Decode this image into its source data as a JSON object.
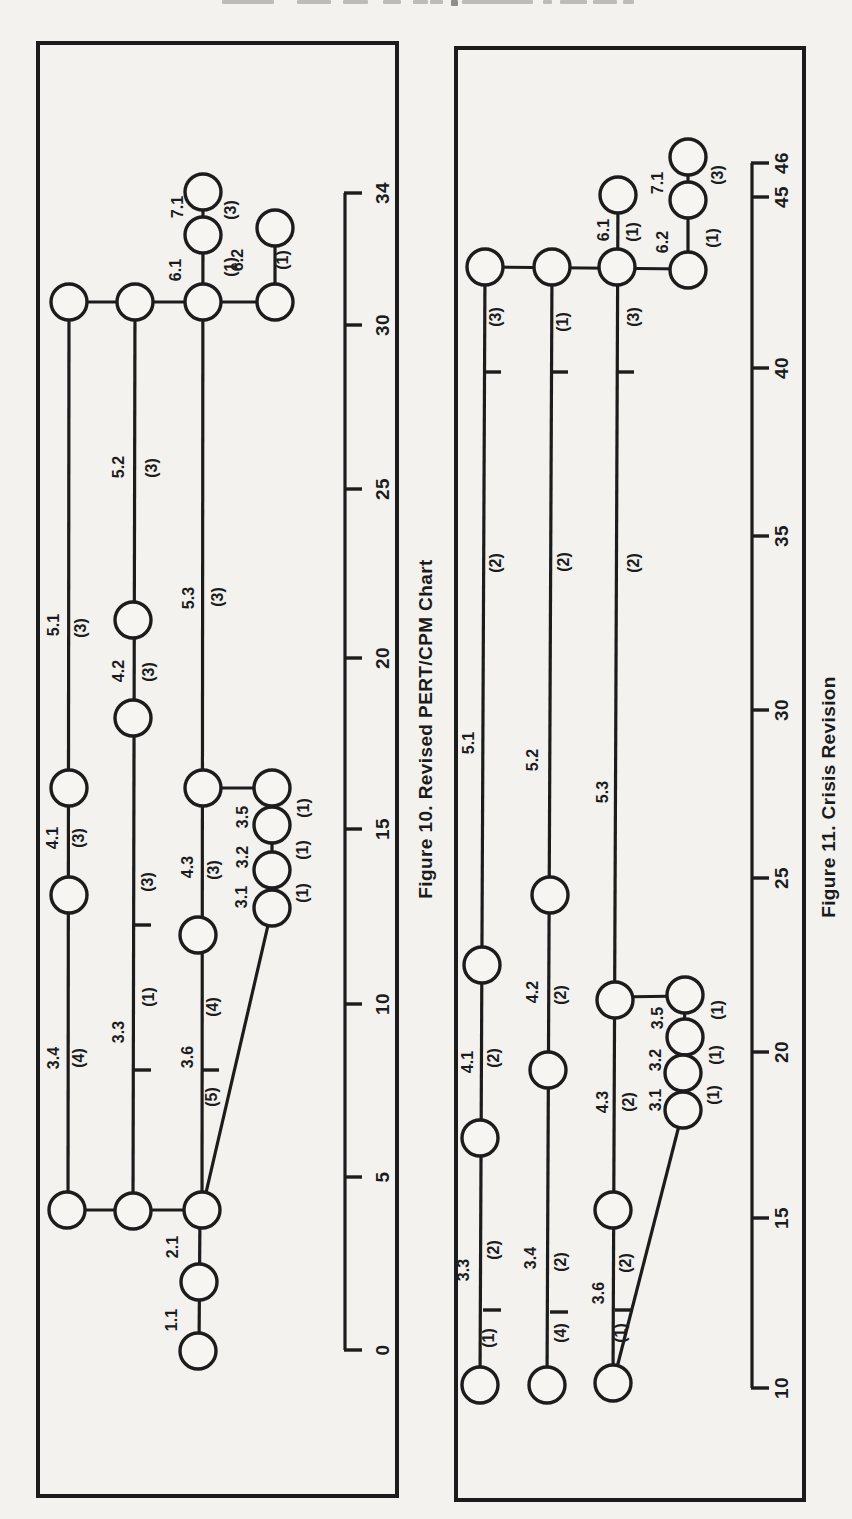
{
  "page": {
    "paper": "#f3f2ee",
    "ink": "#1c1c1c",
    "node_fill": "#f6f5f2"
  },
  "header_fragment": {
    "note": "cut-off bottoms of a text line at top edge of scan",
    "color": "#bdbcb8",
    "dark_color": "#8f8e8a",
    "dashes": [
      {
        "x": 222,
        "w": 52,
        "h": 4,
        "dark": false
      },
      {
        "x": 297,
        "w": 34,
        "h": 4,
        "dark": false
      },
      {
        "x": 343,
        "w": 25,
        "h": 4,
        "dark": false
      },
      {
        "x": 383,
        "w": 18,
        "h": 4,
        "dark": false
      },
      {
        "x": 413,
        "w": 15,
        "h": 4,
        "dark": false
      },
      {
        "x": 430,
        "w": 13,
        "h": 4,
        "dark": false
      },
      {
        "x": 451,
        "w": 7,
        "h": 6,
        "dark": true
      },
      {
        "x": 462,
        "w": 71,
        "h": 4,
        "dark": false
      },
      {
        "x": 543,
        "w": 9,
        "h": 4,
        "dark": false
      },
      {
        "x": 560,
        "w": 27,
        "h": 4,
        "dark": false
      },
      {
        "x": 593,
        "w": 24,
        "h": 4,
        "dark": false
      },
      {
        "x": 623,
        "w": 11,
        "h": 4,
        "dark": false
      }
    ]
  },
  "figures": [
    {
      "id": "figure10",
      "caption": "Figure 10. Revised PERT/CPM Chart",
      "caption_pos": {
        "x": 426,
        "y": 729
      },
      "box": {
        "x": 38,
        "y": 43,
        "w": 359,
        "h": 1453
      },
      "activity_ids": [
        "1.1",
        "2.1",
        "3.1",
        "3.2",
        "3.3",
        "3.4",
        "3.5",
        "3.6",
        "4.1",
        "4.2",
        "4.3",
        "5.1",
        "5.2",
        "5.3",
        "6.1",
        "6.2",
        "7.1"
      ],
      "axis": {
        "x": 345,
        "y1": 193,
        "y2": 1350,
        "tick_len": 17,
        "label_x": 382,
        "ticks": [
          {
            "v": "34",
            "y": 193
          },
          {
            "v": "30",
            "y": 325
          },
          {
            "v": "25",
            "y": 489
          },
          {
            "v": "20",
            "y": 658
          },
          {
            "v": "15",
            "y": 829
          },
          {
            "v": "10",
            "y": 1004
          },
          {
            "v": "5",
            "y": 1177
          },
          {
            "v": "0",
            "y": 1350
          }
        ]
      },
      "lines": [
        [
          69,
          302,
          68,
          1210
        ],
        [
          135,
          302,
          133,
          1211
        ],
        [
          203,
          192,
          202,
          1210
        ],
        [
          275,
          228,
          275,
          302
        ],
        [
          272,
          788,
          272,
          908
        ],
        [
          200,
          1210,
          199,
          1351
        ],
        [
          69,
          302,
          275,
          302
        ],
        [
          67,
          1210,
          202,
          1210
        ],
        [
          203,
          788,
          272,
          788
        ],
        [
          272,
          908,
          202,
          1210
        ]
      ],
      "nodes": [
        [
          69,
          302
        ],
        [
          135,
          302
        ],
        [
          203,
          302
        ],
        [
          275,
          302
        ],
        [
          203,
          235
        ],
        [
          203,
          192
        ],
        [
          275,
          228
        ],
        [
          69,
          788
        ],
        [
          69,
          895
        ],
        [
          133,
          620
        ],
        [
          133,
          718
        ],
        [
          203,
          788
        ],
        [
          198,
          935
        ],
        [
          272,
          788
        ],
        [
          272,
          825
        ],
        [
          272,
          870
        ],
        [
          272,
          908
        ],
        [
          67,
          1210
        ],
        [
          133,
          1211
        ],
        [
          202,
          1210
        ],
        [
          199,
          1282
        ],
        [
          198,
          1351
        ]
      ],
      "row_ticks": [
        [
          135,
          925
        ],
        [
          135,
          1070
        ],
        [
          203,
          1070
        ]
      ],
      "labels": [
        {
          "t": "5.1",
          "x": 53,
          "y": 625
        },
        {
          "t": "(3)",
          "x": 80,
          "y": 628
        },
        {
          "t": "4.1",
          "x": 52,
          "y": 838
        },
        {
          "t": "(3)",
          "x": 78,
          "y": 838
        },
        {
          "t": "3.4",
          "x": 53,
          "y": 1058
        },
        {
          "t": "(4)",
          "x": 78,
          "y": 1058
        },
        {
          "t": "5.2",
          "x": 118,
          "y": 467
        },
        {
          "t": "(3)",
          "x": 151,
          "y": 468
        },
        {
          "t": "4.2",
          "x": 118,
          "y": 671
        },
        {
          "t": "(3)",
          "x": 148,
          "y": 672
        },
        {
          "t": "(3)",
          "x": 147,
          "y": 882
        },
        {
          "t": "(1)",
          "x": 148,
          "y": 997
        },
        {
          "t": "3.3",
          "x": 118,
          "y": 1032
        },
        {
          "t": "5.3",
          "x": 188,
          "y": 598
        },
        {
          "t": "(3)",
          "x": 217,
          "y": 597
        },
        {
          "t": "4.3",
          "x": 187,
          "y": 867
        },
        {
          "t": "(3)",
          "x": 213,
          "y": 870
        },
        {
          "t": "(4)",
          "x": 212,
          "y": 1007
        },
        {
          "t": "3.6",
          "x": 187,
          "y": 1057
        },
        {
          "t": "(5)",
          "x": 211,
          "y": 1097
        },
        {
          "t": "6.1",
          "x": 175,
          "y": 270
        },
        {
          "t": "(1)",
          "x": 230,
          "y": 267
        },
        {
          "t": "7.1",
          "x": 177,
          "y": 207
        },
        {
          "t": "(3)",
          "x": 230,
          "y": 210
        },
        {
          "t": "6.2",
          "x": 237,
          "y": 260
        },
        {
          "t": "(1)",
          "x": 282,
          "y": 260
        },
        {
          "t": "3.5",
          "x": 242,
          "y": 817
        },
        {
          "t": "(1)",
          "x": 303,
          "y": 808
        },
        {
          "t": "3.2",
          "x": 242,
          "y": 857
        },
        {
          "t": "(1)",
          "x": 302,
          "y": 850
        },
        {
          "t": "3.1",
          "x": 241,
          "y": 897
        },
        {
          "t": "(1)",
          "x": 302,
          "y": 893
        },
        {
          "t": "2.1",
          "x": 172,
          "y": 1247
        },
        {
          "t": "1.1",
          "x": 171,
          "y": 1320
        }
      ]
    },
    {
      "id": "figure11",
      "caption": "Figure 11. Crisis Revision",
      "caption_pos": {
        "x": 829,
        "y": 797
      },
      "box": {
        "x": 456,
        "y": 48,
        "w": 348,
        "h": 1452
      },
      "activity_ids": [
        "3.1",
        "3.2",
        "3.3",
        "3.4",
        "3.5",
        "3.6",
        "4.1",
        "4.2",
        "4.3",
        "5.1",
        "5.2",
        "5.3",
        "6.1",
        "6.2",
        "7.1"
      ],
      "axis": {
        "x": 752,
        "y1": 163,
        "y2": 1388,
        "tick_len": 17,
        "label_x": 781,
        "ticks": [
          {
            "v": "46",
            "y": 163
          },
          {
            "v": "45",
            "y": 197
          },
          {
            "v": "40",
            "y": 368
          },
          {
            "v": "35",
            "y": 536
          },
          {
            "v": "30",
            "y": 710
          },
          {
            "v": "25",
            "y": 878
          },
          {
            "v": "20",
            "y": 1052
          },
          {
            "v": "15",
            "y": 1218
          },
          {
            "v": "10",
            "y": 1388
          }
        ]
      },
      "lines": [
        [
          485,
          267,
          480,
          1385
        ],
        [
          552,
          267,
          547,
          1385
        ],
        [
          618,
          195,
          613,
          1383
        ],
        [
          688,
          157,
          688,
          270
        ],
        [
          685,
          995,
          683,
          1110
        ],
        [
          485,
          267,
          688,
          269
        ],
        [
          616,
          997,
          685,
          996
        ],
        [
          683,
          1110,
          613,
          1383
        ]
      ],
      "nodes": [
        [
          485,
          267
        ],
        [
          552,
          267
        ],
        [
          617,
          267
        ],
        [
          688,
          270
        ],
        [
          618,
          195
        ],
        [
          688,
          200
        ],
        [
          688,
          157
        ],
        [
          482,
          965
        ],
        [
          480,
          1138
        ],
        [
          480,
          1385
        ],
        [
          550,
          895
        ],
        [
          548,
          1070
        ],
        [
          547,
          1385
        ],
        [
          615,
          1000
        ],
        [
          613,
          1210
        ],
        [
          613,
          1383
        ],
        [
          685,
          995
        ],
        [
          685,
          1037
        ],
        [
          683,
          1073
        ],
        [
          683,
          1110
        ]
      ],
      "row_ticks": [
        [
          485,
          372
        ],
        [
          552,
          372
        ],
        [
          618,
          372
        ],
        [
          485,
          1310
        ],
        [
          552,
          1312
        ],
        [
          617,
          1310
        ]
      ],
      "labels": [
        {
          "t": "(3)",
          "x": 495,
          "y": 317
        },
        {
          "t": "(1)",
          "x": 562,
          "y": 322
        },
        {
          "t": "(3)",
          "x": 633,
          "y": 317
        },
        {
          "t": "5.1",
          "x": 468,
          "y": 743
        },
        {
          "t": "(2)",
          "x": 495,
          "y": 563
        },
        {
          "t": "5.2",
          "x": 532,
          "y": 760
        },
        {
          "t": "(2)",
          "x": 563,
          "y": 562
        },
        {
          "t": "5.3",
          "x": 602,
          "y": 792
        },
        {
          "t": "(2)",
          "x": 633,
          "y": 563
        },
        {
          "t": "4.1",
          "x": 467,
          "y": 1062
        },
        {
          "t": "(2)",
          "x": 493,
          "y": 1058
        },
        {
          "t": "4.2",
          "x": 532,
          "y": 992
        },
        {
          "t": "(2)",
          "x": 560,
          "y": 995
        },
        {
          "t": "4.3",
          "x": 602,
          "y": 1102
        },
        {
          "t": "(2)",
          "x": 628,
          "y": 1102
        },
        {
          "t": "3.3",
          "x": 463,
          "y": 1270
        },
        {
          "t": "(2)",
          "x": 493,
          "y": 1250
        },
        {
          "t": "(1)",
          "x": 488,
          "y": 1338
        },
        {
          "t": "3.4",
          "x": 530,
          "y": 1258
        },
        {
          "t": "(2)",
          "x": 560,
          "y": 1262
        },
        {
          "t": "(4)",
          "x": 560,
          "y": 1333
        },
        {
          "t": "3.6",
          "x": 598,
          "y": 1293
        },
        {
          "t": "(2)",
          "x": 625,
          "y": 1263
        },
        {
          "t": "(1)",
          "x": 620,
          "y": 1333
        },
        {
          "t": "6.1",
          "x": 603,
          "y": 230
        },
        {
          "t": "(1)",
          "x": 632,
          "y": 232
        },
        {
          "t": "6.2",
          "x": 662,
          "y": 242
        },
        {
          "t": "(1)",
          "x": 712,
          "y": 238
        },
        {
          "t": "7.1",
          "x": 657,
          "y": 183
        },
        {
          "t": "(3)",
          "x": 717,
          "y": 175
        },
        {
          "t": "3.5",
          "x": 657,
          "y": 1018
        },
        {
          "t": "(1)",
          "x": 717,
          "y": 1010
        },
        {
          "t": "3.2",
          "x": 655,
          "y": 1060
        },
        {
          "t": "(1)",
          "x": 715,
          "y": 1055
        },
        {
          "t": "3.1",
          "x": 655,
          "y": 1100
        },
        {
          "t": "(1)",
          "x": 713,
          "y": 1095
        }
      ]
    }
  ]
}
